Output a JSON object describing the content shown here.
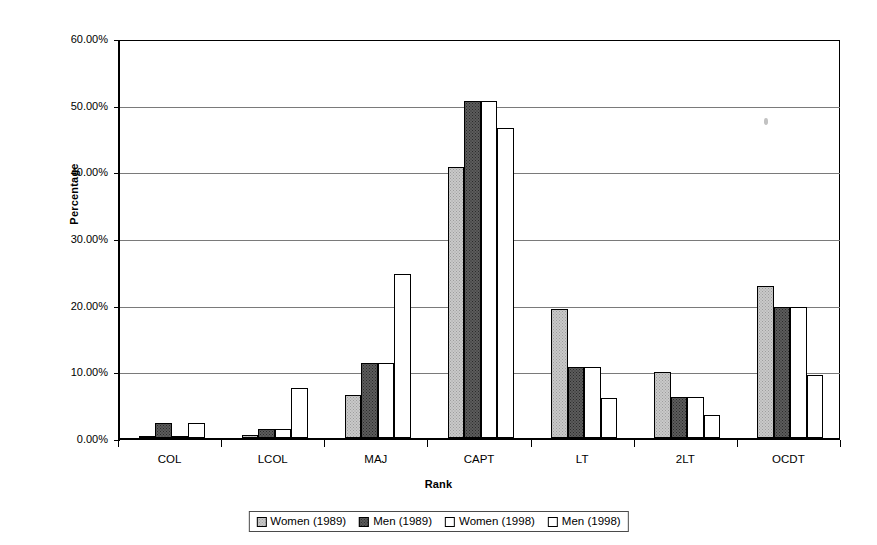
{
  "chart_data": {
    "type": "bar",
    "title": "",
    "xlabel": "Rank",
    "ylabel": "Percentage",
    "categories": [
      "COL",
      "LCOL",
      "MAJ",
      "CAPT",
      "LT",
      "2LT",
      "OCDT"
    ],
    "series": [
      {
        "name": "Women (1989)",
        "values": [
          0.2,
          0.4,
          6.5,
          40.7,
          19.3,
          9.9,
          22.8
        ]
      },
      {
        "name": "Men (1989)",
        "values": [
          2.2,
          1.4,
          11.2,
          50.5,
          10.6,
          6.2,
          19.7
        ]
      },
      {
        "name": "Women (1998)",
        "values": [
          0.3,
          1.3,
          11.2,
          50.5,
          10.6,
          6.2,
          19.7
        ]
      },
      {
        "name": "Men (1998)",
        "values": [
          2.2,
          7.5,
          24.6,
          46.5,
          6.0,
          3.4,
          9.5
        ]
      }
    ],
    "ylim": [
      0,
      60
    ],
    "yticks": [
      0,
      10,
      20,
      30,
      40,
      50,
      60
    ],
    "ytick_labels": [
      "0.00%",
      "10.00%",
      "20.00%",
      "30.00%",
      "40.00%",
      "50.00%",
      "60.00%"
    ],
    "grid": true,
    "legend_position": "bottom",
    "series_colors": [
      "#c9c9c9",
      "#5c5c5c",
      "#ffffff",
      "#ffffff"
    ]
  },
  "legend": {
    "items": [
      {
        "label": "Women (1989)"
      },
      {
        "label": "Men (1989)"
      },
      {
        "label": "Women (1998)"
      },
      {
        "label": "Men (1998)"
      }
    ]
  }
}
